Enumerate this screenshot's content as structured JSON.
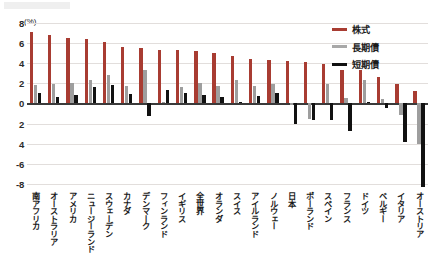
{
  "axis": {
    "unit_label": "(%)",
    "ticks": [
      "8",
      "6",
      "4",
      "2",
      "0",
      "2",
      "4",
      "-6",
      "-8"
    ],
    "tick_values": [
      8,
      6,
      4,
      2,
      0,
      -2,
      -4,
      -6,
      -8
    ]
  },
  "legend": {
    "position": "top-right",
    "items": [
      {
        "label": "株式",
        "color": "#a83c32",
        "key": "equity"
      },
      {
        "label": "長期債",
        "color": "#a8a8a8",
        "key": "long"
      },
      {
        "label": "短期債",
        "color": "#111111",
        "key": "short"
      }
    ]
  },
  "chart_data": {
    "type": "bar",
    "title": "",
    "subtitle": "",
    "xlabel": "",
    "ylabel": "(%)",
    "ylim": [
      -8.6,
      8
    ],
    "grid": true,
    "legend_position": "top-right",
    "categories": [
      "南アフリカ",
      "オーストラリア",
      "アメリカ",
      "ニュージーランド",
      "スウェーデン",
      "カナダ",
      "デンマーク",
      "フィンランド",
      "イギリス",
      "全世界",
      "オランダ",
      "スイス",
      "アイルランド",
      "ノルウェー",
      "日本",
      "ポーランド",
      "スペイン",
      "フランス",
      "ドイツ",
      "ベルギー",
      "イタリア",
      "オーストリア"
    ],
    "series": [
      {
        "name": "株式",
        "color": "#a83c32",
        "values": [
          7.1,
          6.8,
          6.5,
          6.4,
          6.1,
          5.6,
          5.5,
          5.3,
          5.3,
          5.2,
          5.0,
          4.7,
          4.4,
          4.3,
          4.2,
          4.1,
          3.9,
          3.3,
          3.3,
          2.6,
          1.9,
          1.2
        ]
      },
      {
        "name": "長期債",
        "color": "#a8a8a8",
        "values": [
          1.8,
          1.9,
          2.0,
          2.3,
          2.8,
          1.7,
          3.3,
          0.1,
          1.6,
          2.0,
          1.7,
          2.3,
          1.7,
          1.9,
          -0.2,
          -1.5,
          1.9,
          0.5,
          2.3,
          0.4,
          -1.1,
          -4.0
        ]
      },
      {
        "name": "短期債",
        "color": "#111111",
        "values": [
          1.0,
          0.6,
          0.8,
          1.6,
          1.8,
          0.9,
          -1.2,
          1.3,
          1.0,
          0.8,
          0.6,
          0.1,
          0.7,
          1.0,
          -2.0,
          -1.6,
          -1.6,
          -2.7,
          0.1,
          -0.5,
          -3.8,
          -8.3
        ]
      }
    ]
  }
}
